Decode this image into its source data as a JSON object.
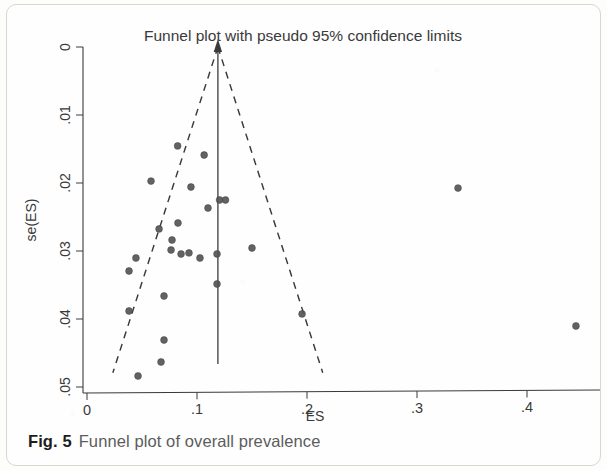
{
  "figure": {
    "caption_number": "Fig. 5",
    "caption_text": "Funnel plot of overall prevalence"
  },
  "chart_data": {
    "type": "scatter",
    "title": "Funnel plot with pseudo 95% confidence limits",
    "xlabel": "ES",
    "ylabel": "se(ES)",
    "xlim": [
      0,
      0.46
    ],
    "ylim": [
      0,
      0.05
    ],
    "y_axis_inverted": true,
    "grid": false,
    "legend": null,
    "x_ticks": [
      0,
      0.1,
      0.2,
      0.3,
      0.4
    ],
    "x_tick_labels": [
      "0",
      ".1",
      ".2",
      ".3",
      ".4"
    ],
    "y_ticks": [
      0,
      0.01,
      0.02,
      0.03,
      0.04,
      0.05
    ],
    "y_tick_labels": [
      "0",
      ".01",
      ".02",
      ".03",
      ".04",
      ".05"
    ],
    "point_color": "#555555",
    "line_color": "#3a3a3a",
    "pooled_effect": 0.119,
    "pooled_line": {
      "x": 0.119,
      "y_from": 0.0,
      "y_to": 0.0466,
      "style": "solid",
      "arrow_at_top": true
    },
    "confidence_limits": {
      "style": "dashed",
      "z": 1.96,
      "left": [
        [
          0.119,
          0.0
        ],
        [
          0.0235,
          0.0479
        ]
      ],
      "right": [
        [
          0.119,
          0.0
        ],
        [
          0.2143,
          0.0479
        ]
      ]
    },
    "points": [
      {
        "x": 0.0824,
        "y": 0.01455
      },
      {
        "x": 0.1065,
        "y": 0.01588
      },
      {
        "x": 0.0582,
        "y": 0.01971
      },
      {
        "x": 0.0945,
        "y": 0.02059
      },
      {
        "x": 0.1205,
        "y": 0.0225
      },
      {
        "x": 0.1259,
        "y": 0.0225
      },
      {
        "x": 0.11,
        "y": 0.02368
      },
      {
        "x": 0.0827,
        "y": 0.02588
      },
      {
        "x": 0.0655,
        "y": 0.02676
      },
      {
        "x": 0.0773,
        "y": 0.02838
      },
      {
        "x": 0.0445,
        "y": 0.03103
      },
      {
        "x": 0.0764,
        "y": 0.02985
      },
      {
        "x": 0.0855,
        "y": 0.03044
      },
      {
        "x": 0.0927,
        "y": 0.03029
      },
      {
        "x": 0.1027,
        "y": 0.03103
      },
      {
        "x": 0.1182,
        "y": 0.03044
      },
      {
        "x": 0.0382,
        "y": 0.03294
      },
      {
        "x": 0.1182,
        "y": 0.03485
      },
      {
        "x": 0.1955,
        "y": 0.03926
      },
      {
        "x": 0.07,
        "y": 0.03662
      },
      {
        "x": 0.15,
        "y": 0.02956
      },
      {
        "x": 0.0382,
        "y": 0.03882
      },
      {
        "x": 0.07,
        "y": 0.04309
      },
      {
        "x": 0.0673,
        "y": 0.04632
      },
      {
        "x": 0.0464,
        "y": 0.04838
      },
      {
        "x": 0.3373,
        "y": 0.02074
      },
      {
        "x": 0.4445,
        "y": 0.04103
      }
    ]
  }
}
